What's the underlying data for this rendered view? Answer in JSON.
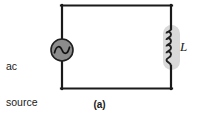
{
  "figure": {
    "caption": "(a)",
    "background_color": "#ffffff",
    "wire_color": "#1a1a1a",
    "component_fill": "#8c8c8c",
    "shadow_fill": "#d8d8d8"
  },
  "source": {
    "label_line1": "ac",
    "label_line2": "source",
    "symbol": "sine-wave",
    "icon_name": "ac-source-icon"
  },
  "inductor": {
    "label": "L",
    "icon_name": "inductor-coil-icon",
    "turns": 4
  },
  "circuit": {
    "left_x": 62,
    "right_x": 172,
    "top_y": 5,
    "bottom_y": 89
  }
}
